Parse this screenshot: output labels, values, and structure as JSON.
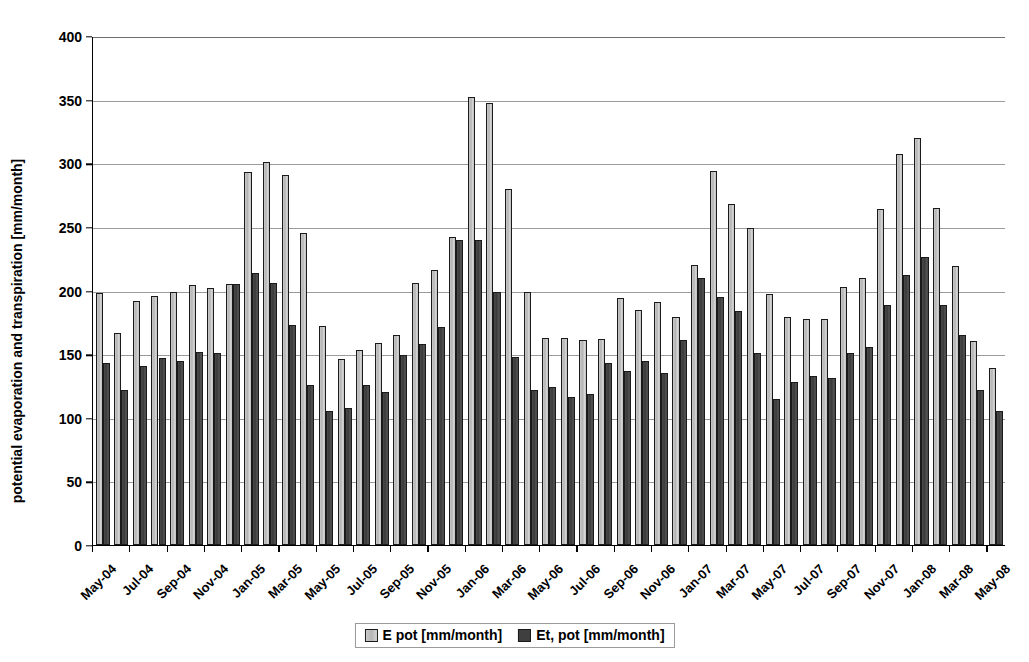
{
  "chart_data": {
    "type": "bar",
    "title": "",
    "xlabel": "",
    "ylabel": "potential evaporation and transpiration [mm/month]",
    "ylim": [
      0,
      400
    ],
    "ytick_step": 50,
    "yticks": [
      0,
      50,
      100,
      150,
      200,
      250,
      300,
      350,
      400
    ],
    "grid": "horizontal",
    "legend_position": "bottom",
    "xtick_label_interval": 2,
    "categories": [
      "May-04",
      "Jun-04",
      "Jul-04",
      "Aug-04",
      "Sep-04",
      "Oct-04",
      "Nov-04",
      "Dec-04",
      "Jan-05",
      "Feb-05",
      "Mar-05",
      "Apr-05",
      "May-05",
      "Jun-05",
      "Jul-05",
      "Aug-05",
      "Sep-05",
      "Oct-05",
      "Nov-05",
      "Dec-05",
      "Jan-06",
      "Feb-06",
      "Mar-06",
      "Apr-06",
      "May-06",
      "Jun-06",
      "Jul-06",
      "Aug-06",
      "Sep-06",
      "Oct-06",
      "Nov-06",
      "Dec-06",
      "Jan-07",
      "Feb-07",
      "Mar-07",
      "Apr-07",
      "May-07",
      "Jun-07",
      "Jul-07",
      "Aug-07",
      "Sep-07",
      "Oct-07",
      "Nov-07",
      "Dec-07",
      "Jan-08",
      "Feb-08",
      "Mar-08",
      "Apr-08",
      "May-08"
    ],
    "tick_labels": [
      "May-04",
      "Jul-04",
      "Sep-04",
      "Nov-04",
      "Jan-05",
      "Mar-05",
      "May-05",
      "Jul-05",
      "Sep-05",
      "Nov-05",
      "Jan-06",
      "Mar-06",
      "May-06",
      "Jul-06",
      "Sep-06",
      "Nov-06",
      "Jan-07",
      "Mar-07",
      "May-07",
      "Jul-07",
      "Sep-07",
      "Nov-07",
      "Jan-08",
      "Mar-08",
      "May-08"
    ],
    "series": [
      {
        "name": "E pot [mm/month]",
        "color": "#c2c2c2",
        "values": [
          198,
          167,
          192,
          196,
          199,
          204,
          202,
          205,
          293,
          301,
          291,
          245,
          172,
          146,
          153,
          159,
          165,
          206,
          216,
          242,
          352,
          347,
          280,
          199,
          163,
          163,
          161,
          162,
          194,
          185,
          191,
          179,
          220,
          294,
          268,
          249,
          197,
          179,
          178,
          178,
          203,
          210,
          264,
          307,
          320,
          265,
          219,
          160,
          139
        ]
      },
      {
        "name": "Et, pot [mm/month]",
        "color": "#3f3f3f",
        "values": [
          143,
          122,
          141,
          147,
          145,
          152,
          151,
          205,
          214,
          206,
          173,
          126,
          105,
          108,
          126,
          120,
          149,
          158,
          171,
          240,
          240,
          199,
          148,
          122,
          124,
          116,
          119,
          143,
          137,
          145,
          135,
          161,
          210,
          195,
          184,
          151,
          115,
          128,
          133,
          131,
          151,
          156,
          189,
          212,
          226,
          189,
          165,
          122,
          105
        ]
      }
    ]
  },
  "legend": {
    "items": [
      {
        "label": "E pot [mm/month]"
      },
      {
        "label": "Et, pot [mm/month]"
      }
    ]
  }
}
